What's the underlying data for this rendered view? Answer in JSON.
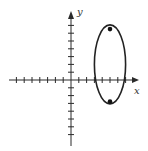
{
  "figure": {
    "type": "coordinate-plane-ellipse",
    "axes": {
      "x_label": "x",
      "y_label": "y",
      "x_ticks_negative": 7,
      "x_ticks_positive": 7,
      "y_ticks_positive": 7,
      "y_ticks_negative": 7
    },
    "ellipse": {
      "center": [
        5,
        2
      ],
      "semi_axis_vertical": 5,
      "semi_axis_horizontal": 2,
      "orientation": "vertical"
    },
    "points": [
      {
        "name": "focus-top",
        "x": 5,
        "y": 6.58
      },
      {
        "name": "focus-bottom",
        "x": 5,
        "y": -2.58
      }
    ],
    "colors": {
      "line": "#222222",
      "background": "#ffffff"
    }
  }
}
